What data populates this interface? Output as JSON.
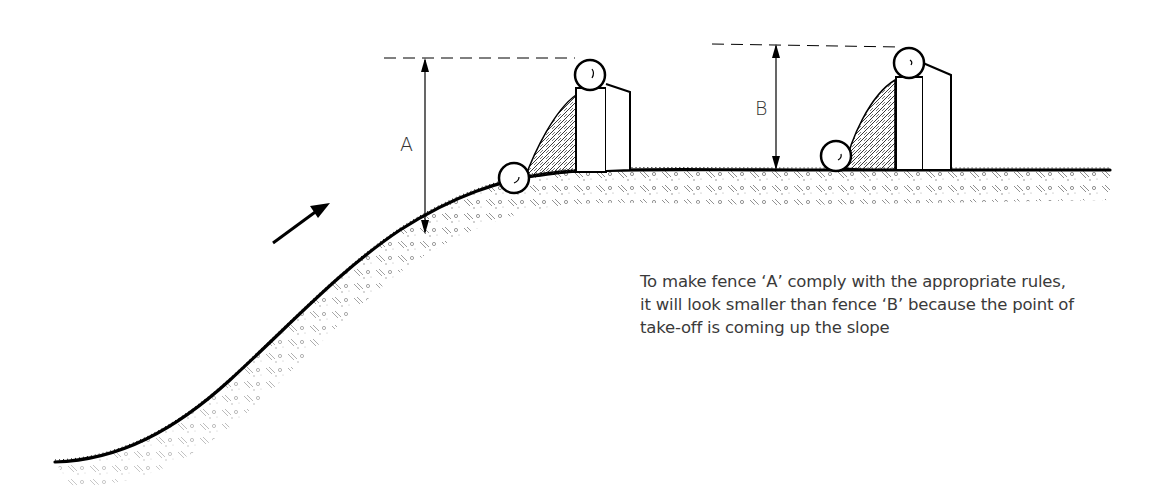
{
  "diagram": {
    "labels": {
      "fence_a": "A",
      "fence_b": "B"
    },
    "caption": {
      "lines": [
        "To make fence ‘A’ comply with the appropriate  rules,",
        "it will look smaller than fence ‘B’ because the point of",
        "take-off is coming up the slope"
      ]
    },
    "elements": {
      "direction_arrow": "arrow-up-right-icon",
      "fence_a_position": "on slope crest",
      "fence_b_position": "on flat ground"
    },
    "colors": {
      "ink": "#000000",
      "text": "#3a3a3a",
      "background": "#ffffff"
    }
  }
}
